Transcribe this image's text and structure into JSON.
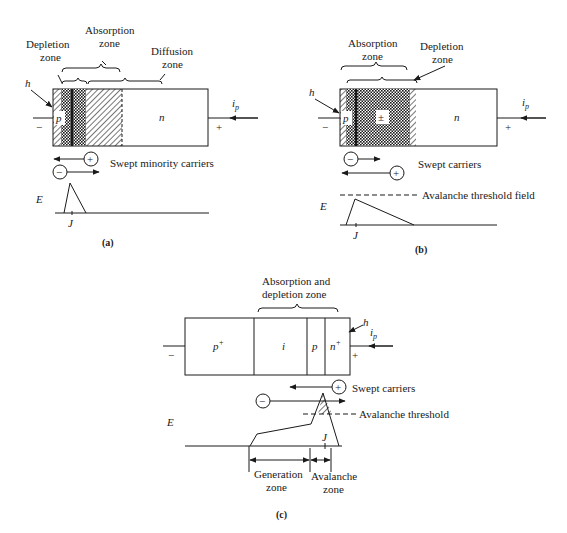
{
  "panel_a": {
    "caption": "(a)",
    "labels": {
      "depletion_zone_1": "Depletion",
      "depletion_zone_2": "zone",
      "absorption_zone_1": "Absorption",
      "absorption_zone_2": "zone",
      "diffusion_zone_1": "Diffusion",
      "diffusion_zone_2": "zone",
      "h": "h",
      "p": "p",
      "n": "n",
      "minus": "−",
      "plus": "+",
      "ip": "i",
      "ip_sub": "p",
      "swept": "Swept minority carriers",
      "E": "E",
      "J": "J"
    }
  },
  "panel_b": {
    "caption": "(b)",
    "labels": {
      "absorption_zone_1": "Absorption",
      "absorption_zone_2": "zone",
      "depletion_zone_1": "Depletion",
      "depletion_zone_2": "zone",
      "h": "h",
      "p": "p",
      "pm": "±",
      "n": "n",
      "minus": "−",
      "plus": "+",
      "ip": "i",
      "ip_sub": "p",
      "swept": "Swept carriers",
      "threshold": "Avalanche threshold field",
      "E": "E",
      "J": "J"
    }
  },
  "panel_c": {
    "caption": "(c)",
    "labels": {
      "abs_dep_1": "Absorption and",
      "abs_dep_2": "depletion zone",
      "h": "h",
      "p_plus": "p",
      "p_plus_sup": "+",
      "i": "i",
      "p": "p",
      "n_plus": "n",
      "n_plus_sup": "+",
      "minus": "−",
      "plus": "+",
      "ip": "i",
      "ip_sub": "p",
      "swept": "Swept carriers",
      "threshold": "Avalanche threshold",
      "E": "E",
      "J": "J",
      "generation_1": "Generation",
      "generation_2": "zone",
      "avalanche_1": "Avalanche",
      "avalanche_2": "zone"
    }
  }
}
